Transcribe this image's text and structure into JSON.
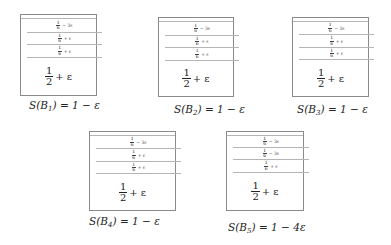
{
  "bins": [
    {
      "id": "B1",
      "cells": [
        {
          "num": "1",
          "den": "6",
          "rest": "− 3ε"
        },
        {
          "num": "1",
          "den": "6",
          "rest": "+ ε"
        },
        {
          "num": "1",
          "den": "6",
          "rest": "+ ε"
        }
      ],
      "big": {
        "num": "1",
        "den": "2",
        "rest": "+ ε"
      },
      "label": {
        "prefix": "S(B",
        "sub": "1",
        "suffix": ") = 1 − ε"
      }
    },
    {
      "id": "B2",
      "cells": [
        {
          "num": "1",
          "den": "6",
          "rest": "− 3ε"
        },
        {
          "num": "1",
          "den": "6",
          "rest": "+ ε"
        },
        {
          "num": "1",
          "den": "6",
          "rest": "+ ε"
        }
      ],
      "big": {
        "num": "1",
        "den": "2",
        "rest": "+ ε"
      },
      "label": {
        "prefix": "S(B",
        "sub": "2",
        "suffix": ") = 1 − ε"
      }
    },
    {
      "id": "B3",
      "cells": [
        {
          "num": "1",
          "den": "6",
          "rest": "− 3ε"
        },
        {
          "num": "1",
          "den": "6",
          "rest": "+ ε"
        },
        {
          "num": "1",
          "den": "6",
          "rest": "+ ε"
        }
      ],
      "big": {
        "num": "1",
        "den": "2",
        "rest": "+ ε"
      },
      "label": {
        "prefix": "S(B",
        "sub": "3",
        "suffix": ") = 1 − ε"
      }
    },
    {
      "id": "B4",
      "cells": [
        {
          "num": "1",
          "den": "6",
          "rest": "− 3ε"
        },
        {
          "num": "1",
          "den": "6",
          "rest": "+ ε"
        },
        {
          "num": "1",
          "den": "6",
          "rest": "+ ε"
        }
      ],
      "big": {
        "num": "1",
        "den": "2",
        "rest": "+ ε"
      },
      "label": {
        "prefix": "S(B",
        "sub": "4",
        "suffix": ") = 1 − ε"
      }
    },
    {
      "id": "B5",
      "cells": [
        {
          "num": "1",
          "den": "6",
          "rest": "− 3ε"
        },
        {
          "num": "1",
          "den": "6",
          "rest": "− 3ε"
        },
        {
          "num": "1",
          "den": "6",
          "rest": "+ ε"
        }
      ],
      "big": {
        "num": "1",
        "den": "2",
        "rest": "+ ε"
      },
      "label": {
        "prefix": "S(B",
        "sub": "5",
        "suffix": ") = 1 − 4ε"
      }
    }
  ]
}
